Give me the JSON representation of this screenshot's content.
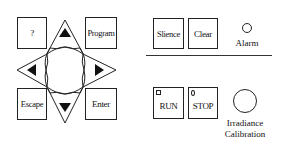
{
  "keypad": {
    "help_label": "?",
    "program_label": "Program",
    "escape_label": "Escape",
    "enter_label": "Enter",
    "dpad": {
      "up": "arrow-up",
      "down": "arrow-down",
      "left": "arrow-left",
      "right": "arrow-right"
    }
  },
  "alarm_panel": {
    "silence_label": "Slience",
    "clear_label": "Clear",
    "alarm_label": "Alarm"
  },
  "run_panel": {
    "run_label": "RUN",
    "stop_label": "STOP",
    "calibration_label_line1": "Irradiance",
    "calibration_label_line2": "Calibration"
  }
}
